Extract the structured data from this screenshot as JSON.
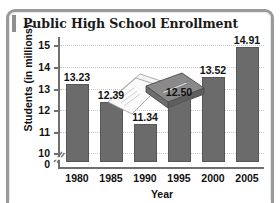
{
  "title": "Public High School Enrollment",
  "decoration": {
    "name": "book-and-papers-clipart"
  },
  "chart_data": {
    "type": "bar",
    "title": "Public High School Enrollment",
    "xlabel": "Year",
    "ylabel": "Students (in millions)",
    "categories": [
      "1980",
      "1985",
      "1990",
      "1995",
      "2000",
      "2005"
    ],
    "values": [
      13.23,
      12.39,
      11.34,
      12.5,
      13.52,
      14.91
    ],
    "value_labels": [
      "13.23",
      "12.39",
      "11.34",
      "12.50",
      "13.52",
      "14.91"
    ],
    "ytick_labels": [
      "0",
      "10",
      "11",
      "12",
      "13",
      "14",
      "15"
    ],
    "ylim": [
      9.6,
      15.3
    ],
    "axis_break": true,
    "grid": true,
    "legend": null,
    "bar_color": "#6b6b6b",
    "grid_color": "#c9c9c9",
    "axis_color": "#6f6f6f"
  }
}
